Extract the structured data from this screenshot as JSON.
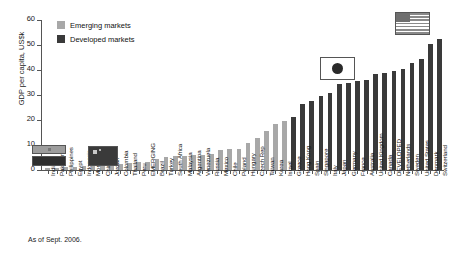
{
  "chart_data": {
    "type": "bar",
    "title": "",
    "subtitle": "",
    "xlabel": "",
    "ylabel": "GDP per capita, US$k",
    "ylim": [
      0,
      60
    ],
    "yticks": [
      0,
      10,
      20,
      30,
      40,
      50,
      60
    ],
    "grid": false,
    "legend_position": "top-left",
    "footnote": "As of Sept. 2006.",
    "legend": [
      {
        "name": "Emerging markets",
        "color": "#a8a8a8"
      },
      {
        "name": "Developed markets",
        "color": "#3a3a3a"
      }
    ],
    "categories": [
      "India",
      "Pakistan",
      "Philippines",
      "Egypt",
      "Indonesia",
      "Morocco",
      "China",
      "Jordan",
      "Colombia",
      "Thailand",
      "Peru",
      "EMERGING",
      "Brazil",
      "Turkey",
      "South Africa",
      "Malaysia",
      "Argentina",
      "Venezuela",
      "Russia",
      "Mexico",
      "Chile",
      "Poland",
      "Hungary",
      "Czech Rep",
      "Taiwan",
      "Korea",
      "Israel",
      "Greece",
      "Hong Kong",
      "Spain",
      "Singapore",
      "Italy",
      "Japan",
      "Germany",
      "France",
      "Australia",
      "United Kingdom",
      "Canada",
      "DEVELOPED",
      "Netherlands",
      "Sweden",
      "United States",
      "Denmark",
      "Switzerland"
    ],
    "values": [
      0.8,
      0.9,
      1.2,
      1.3,
      1.5,
      1.8,
      2.0,
      2.4,
      2.6,
      3.0,
      3.2,
      3.4,
      4.6,
      5.3,
      5.5,
      5.8,
      5.9,
      6.2,
      6.6,
      7.9,
      8.3,
      8.5,
      11.0,
      13.0,
      15.8,
      18.4,
      19.8,
      21.3,
      26.5,
      27.5,
      29.5,
      31.0,
      34.5,
      35.0,
      35.5,
      36.0,
      38.5,
      39.0,
      39.5,
      40.5,
      43.0,
      44.5,
      50.5,
      52.5
    ],
    "series_groups": [
      {
        "name": "Emerging markets",
        "color": "#a8a8a8",
        "start_index": 0,
        "end_index": 26
      },
      {
        "name": "Developed markets",
        "color": "#3a3a3a",
        "start_index": 27,
        "end_index": 43
      }
    ],
    "annotations": [
      {
        "name": "united-states-flag",
        "label": "United States",
        "type": "flag"
      },
      {
        "name": "japan-flag",
        "label": "Japan",
        "type": "flag"
      },
      {
        "name": "china-flag",
        "label": "China",
        "type": "flag"
      },
      {
        "name": "india-flag",
        "label": "India",
        "type": "flag"
      }
    ]
  }
}
